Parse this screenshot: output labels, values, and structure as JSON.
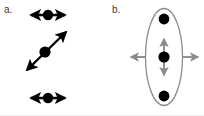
{
  "figure": {
    "width": 204,
    "height": 116,
    "background": "#ffffff",
    "caption_labels": {
      "panel_a": "a.",
      "panel_b": "b."
    },
    "colors": {
      "particle_fill": "#000000",
      "arrow_black": "#000000",
      "arrow_gray": "#8c8c8c",
      "ellipse_stroke": "#8c8c8c",
      "label_text": "#3a3a3a",
      "background": "#ffffff"
    },
    "panel_a": {
      "label": "a.",
      "description": "Three isolated particles with transition dipole arrows",
      "elements": [
        {
          "name": "top-dipole",
          "particle_center": [
            48,
            15
          ],
          "particle_radius": 5.2,
          "arrow_type": "double-headed",
          "orientation": "horizontal",
          "angle_deg": 0,
          "color": "#000000",
          "from": [
            31,
            15
          ],
          "to": [
            65,
            15
          ]
        },
        {
          "name": "middle-dipole",
          "particle_center": [
            45,
            52
          ],
          "particle_radius": 5.6,
          "arrow_type": "double-headed",
          "orientation": "diagonal",
          "angle_deg": -41,
          "color": "#000000",
          "from": [
            27,
            70
          ],
          "to": [
            66,
            32
          ]
        },
        {
          "name": "bottom-dipole",
          "particle_center": [
            48,
            98
          ],
          "particle_radius": 5.2,
          "arrow_type": "double-headed",
          "orientation": "horizontal",
          "angle_deg": 0,
          "color": "#000000",
          "from": [
            31,
            98
          ],
          "to": [
            65,
            98
          ]
        }
      ]
    },
    "panel_b": {
      "label": "b.",
      "description": "Three aligned particles enclosed in an ellipse with one vertical inner arrow and two outward horizontal arrows",
      "ellipse": {
        "center": [
          164,
          57
        ],
        "rx": 18.5,
        "ry": 48.5,
        "stroke": "#8c8c8c",
        "stroke_width": 1.3,
        "fill": "none"
      },
      "particles": [
        {
          "name": "top-particle",
          "center": [
            164,
            19
          ],
          "radius": 5.4,
          "fill": "#000000"
        },
        {
          "name": "middle-particle",
          "center": [
            164,
            57
          ],
          "radius": 5.6,
          "fill": "#000000"
        },
        {
          "name": "bottom-particle",
          "center": [
            164,
            96
          ],
          "radius": 5.4,
          "fill": "#000000"
        }
      ],
      "arrows": [
        {
          "name": "inner-vertical-arrow",
          "arrow_type": "double-headed",
          "orientation": "vertical",
          "color": "#8c8c8c",
          "from": [
            164,
            75
          ],
          "to": [
            164,
            39
          ]
        },
        {
          "name": "left-outward-arrow",
          "arrow_type": "single-headed",
          "orientation": "horizontal-left",
          "color": "#8c8c8c",
          "from": [
            146,
            57
          ],
          "to": [
            131,
            57
          ]
        },
        {
          "name": "right-outward-arrow",
          "arrow_type": "single-headed",
          "orientation": "horizontal-right",
          "color": "#8c8c8c",
          "from": [
            182,
            57
          ],
          "to": [
            198,
            57
          ]
        }
      ]
    }
  }
}
